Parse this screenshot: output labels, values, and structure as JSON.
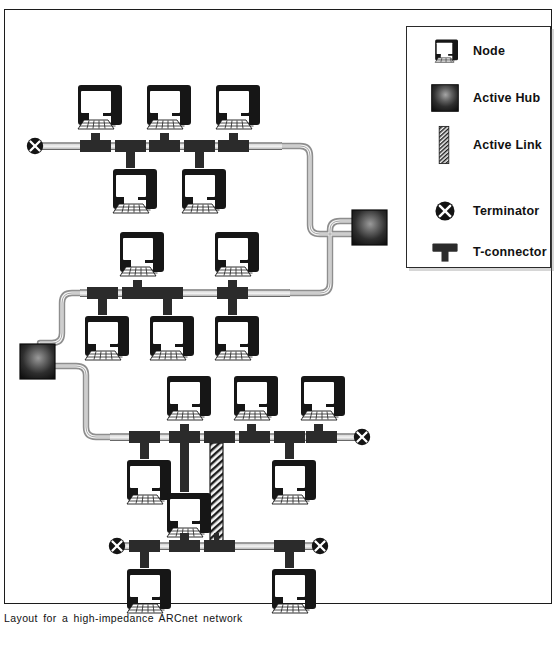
{
  "caption": "Layout for a high-impedance ARCnet network",
  "colors": {
    "ink": "#1c1c1c",
    "node_body": "#161616",
    "node_screen": "#ffffff",
    "connector": "#2b2b2b",
    "bus_core": "#b8b8b8",
    "cable_outline": "#8c8c8c",
    "cable_fill": "#f2f2f2",
    "hub_dark": "#1a1a1a",
    "hub_light": "#8a8a8a",
    "frame": "#1c1c1c",
    "background": "#ffffff"
  },
  "legend": {
    "items": [
      {
        "label": "Node",
        "icon": "node-icon"
      },
      {
        "label": "Active Hub",
        "icon": "active-hub-icon"
      },
      {
        "label": "Active Link",
        "icon": "active-link-icon"
      },
      {
        "label": "Terminator",
        "icon": "terminator-icon"
      },
      {
        "label": "T-connector",
        "icon": "t-connector-icon"
      }
    ]
  },
  "diagram": {
    "type": "network-topology",
    "technology": "ARCnet",
    "impedance": "high-impedance",
    "segments": [
      {
        "id": "segment-1",
        "bus_y": 146,
        "bus_x1": 38,
        "bus_x2": 282,
        "terminators": [
          "left"
        ],
        "nodes_above": 3,
        "nodes_below": 2,
        "t_connectors": 5,
        "uplink": "hub-1"
      },
      {
        "id": "segment-2",
        "bus_y": 293,
        "bus_x1": 80,
        "bus_x2": 290,
        "terminators": [],
        "nodes_above": 2,
        "nodes_below": 3,
        "t_connectors": 5,
        "uplink": "hub-1",
        "downlink": "hub-2"
      },
      {
        "id": "segment-3",
        "bus_y": 437,
        "bus_x1": 110,
        "bus_x2": 362,
        "terminators": [
          "right"
        ],
        "nodes_above": 3,
        "nodes_below": 2,
        "t_connectors": 6,
        "uplink": "hub-2",
        "active_link": "segment-4"
      },
      {
        "id": "segment-4",
        "bus_y": 546,
        "bus_x1": 113,
        "bus_x2": 323,
        "terminators": [
          "left",
          "right"
        ],
        "nodes_above": 1,
        "nodes_below": 2,
        "t_connectors": 5
      }
    ],
    "hubs": [
      {
        "id": "hub-1",
        "x": 352,
        "y": 210,
        "ports": 3
      },
      {
        "id": "hub-2",
        "x": 20,
        "y": 344,
        "ports": 3
      }
    ],
    "counts": {
      "nodes": 16,
      "hubs": 2,
      "terminators": 4,
      "active_links": 1
    }
  }
}
